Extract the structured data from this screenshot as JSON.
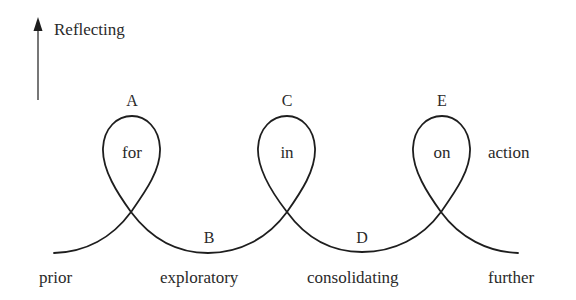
{
  "axis": {
    "label": "Reflecting"
  },
  "points": {
    "A": "A",
    "B": "B",
    "C": "C",
    "D": "D",
    "E": "E"
  },
  "loops": {
    "first": "for",
    "second": "in",
    "third": "on",
    "after": "action"
  },
  "stages": {
    "prior": "prior",
    "exploratory": "exploratory",
    "consolidating": "consolidating",
    "further": "further"
  },
  "colors": {
    "stroke": "#1e1e1e",
    "text": "#2a2a2a",
    "background": "#ffffff"
  }
}
